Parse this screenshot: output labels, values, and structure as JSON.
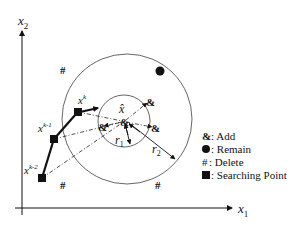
{
  "axes": {
    "x_label": "x",
    "x_sub": "1",
    "y_label": "x",
    "y_sub": "2"
  },
  "points": {
    "center_label": "x̂",
    "xk": {
      "base": "x",
      "sup": "k"
    },
    "xk1": {
      "base": "x",
      "sup": "k-1"
    },
    "xk2": {
      "base": "x",
      "sup": "k-2"
    }
  },
  "radii": {
    "r1": {
      "base": "r",
      "sub": "1"
    },
    "r2": {
      "base": "r",
      "sub": "2"
    }
  },
  "markers": {
    "add": "&",
    "delete": "#"
  },
  "legend": {
    "items": [
      {
        "symbol": "&",
        "text": ": Add"
      },
      {
        "symbol": "dot",
        "text": ": Remain"
      },
      {
        "symbol": "#",
        "text": ": Delete"
      },
      {
        "symbol": "square",
        "text": ": Searching Point"
      }
    ]
  },
  "colors": {
    "line": "#111111",
    "circle": "#555555"
  }
}
